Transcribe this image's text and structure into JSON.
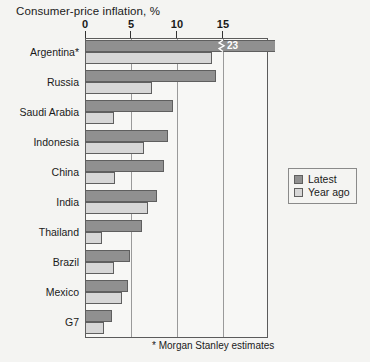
{
  "chart_data": {
    "type": "bar",
    "orientation": "horizontal",
    "title": "Consumer-price inflation, %",
    "xlabel": "",
    "ylabel": "",
    "xlim": [
      0,
      19.9
    ],
    "xticks": [
      0,
      5,
      10,
      15
    ],
    "xtick_labels": [
      "0",
      "5",
      "10",
      "15"
    ],
    "grid": true,
    "legend_position": "right",
    "categories": [
      "Argentina*",
      "Russia",
      "Saudi Arabia",
      "Indonesia",
      "China",
      "India",
      "Thailand",
      "Brazil",
      "Mexico",
      "G7"
    ],
    "series": [
      {
        "name": "Latest",
        "color": "#909090",
        "values": [
          23.0,
          14.2,
          9.6,
          9.0,
          8.6,
          7.8,
          6.2,
          4.9,
          4.7,
          2.9
        ]
      },
      {
        "name": "Year ago",
        "color": "#d6d6d6",
        "values": [
          13.8,
          7.3,
          3.1,
          6.4,
          3.3,
          6.9,
          1.8,
          3.1,
          4.0,
          2.1
        ]
      }
    ],
    "annotations": [
      {
        "text": "23",
        "category": "Argentina*",
        "series": "Latest",
        "note": "bar truncated with axis-break marker"
      }
    ],
    "footnote": "* Morgan Stanley estimates"
  },
  "legend": {
    "items": [
      {
        "label": "Latest",
        "color": "#909090"
      },
      {
        "label": "Year ago",
        "color": "#d6d6d6"
      }
    ]
  }
}
